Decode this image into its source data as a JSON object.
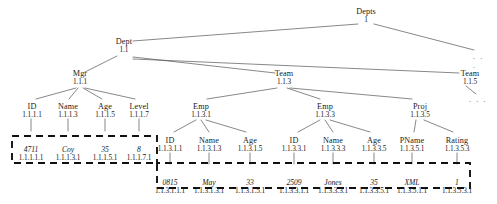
{
  "figure": {
    "kind": "xml-tree-with-dewey-ids",
    "title": "",
    "dots_label": ". . ."
  },
  "nodes": [
    {
      "id": "depts",
      "label": "Depts",
      "dewey": "1",
      "x": 366,
      "y": 8,
      "type": "element"
    },
    {
      "id": "dept",
      "label": "Dept",
      "dewey": "1.1",
      "x": 124,
      "y": 38,
      "type": "element"
    },
    {
      "id": "mgr",
      "label": "Mgr",
      "dewey": "1.1.1",
      "x": 80,
      "y": 70,
      "type": "element"
    },
    {
      "id": "team1",
      "label": "Team",
      "dewey": "1.1.3",
      "x": 284,
      "y": 70,
      "type": "element"
    },
    {
      "id": "team2",
      "label": "Team",
      "dewey": "1.1.5",
      "x": 470,
      "y": 70,
      "type": "element"
    },
    {
      "id": "mgr_id",
      "label": "ID",
      "dewey": "1.1.1.1",
      "x": 32,
      "y": 103,
      "type": "element"
    },
    {
      "id": "mgr_name",
      "label": "Name",
      "dewey": "1.1.1.3",
      "x": 68,
      "y": 103,
      "type": "element"
    },
    {
      "id": "mgr_age",
      "label": "Age",
      "dewey": "1.1.1.5",
      "x": 105,
      "y": 103,
      "type": "element"
    },
    {
      "id": "mgr_level",
      "label": "Level",
      "dewey": "1.1.1.7",
      "x": 139,
      "y": 103,
      "type": "element"
    },
    {
      "id": "emp1",
      "label": "Emp",
      "dewey": "1.1.3.1",
      "x": 201,
      "y": 103,
      "type": "element"
    },
    {
      "id": "emp2",
      "label": "Emp",
      "dewey": "1.1.3.3",
      "x": 325,
      "y": 103,
      "type": "element"
    },
    {
      "id": "proj",
      "label": "Proj",
      "dewey": "1.1.3.5",
      "x": 420,
      "y": 103,
      "type": "element"
    },
    {
      "id": "e1_id",
      "label": "ID",
      "dewey": "1.1.3.1.1",
      "x": 170,
      "y": 137,
      "type": "element"
    },
    {
      "id": "e1_name",
      "label": "Name",
      "dewey": "1.1.3.1.3",
      "x": 209,
      "y": 137,
      "type": "element"
    },
    {
      "id": "e1_age",
      "label": "Age",
      "dewey": "1.1.3.1.5",
      "x": 250,
      "y": 137,
      "type": "element"
    },
    {
      "id": "e2_id",
      "label": "ID",
      "dewey": "1.1.3.3.1",
      "x": 294,
      "y": 137,
      "type": "element"
    },
    {
      "id": "e2_name",
      "label": "Name",
      "dewey": "1.1.3.3.3",
      "x": 333,
      "y": 137,
      "type": "element"
    },
    {
      "id": "e2_age",
      "label": "Age",
      "dewey": "1.1.3.3.5",
      "x": 374,
      "y": 137,
      "type": "element"
    },
    {
      "id": "p_pname",
      "label": "PName",
      "dewey": "1.1.3.5.1",
      "x": 412,
      "y": 137,
      "type": "element"
    },
    {
      "id": "p_rating",
      "label": "Rating",
      "dewey": "1.1.3.5.3",
      "x": 457,
      "y": 137,
      "type": "element"
    }
  ],
  "values": [
    {
      "id": "v_mgr_id",
      "text": "4711",
      "dewey": "1.1.1.1.1",
      "x": 31,
      "y": 146,
      "type": "text"
    },
    {
      "id": "v_mgr_name",
      "text": "Coy",
      "dewey": "1.1.1.3.1",
      "x": 68,
      "y": 146,
      "type": "text"
    },
    {
      "id": "v_mgr_age",
      "text": "35",
      "dewey": "1.1.1.5.1",
      "x": 105,
      "y": 146,
      "type": "text"
    },
    {
      "id": "v_mgr_level",
      "text": "8",
      "dewey": "1.1.1.7.1",
      "x": 139,
      "y": 146,
      "type": "text"
    },
    {
      "id": "v_e1_id",
      "text": "0815",
      "dewey": "1.1.3.1.1.1",
      "x": 170,
      "y": 179,
      "type": "text"
    },
    {
      "id": "v_e1_name",
      "text": "May",
      "dewey": "1.1.3.1.3.1",
      "x": 209,
      "y": 179,
      "type": "text"
    },
    {
      "id": "v_e1_age",
      "text": "33",
      "dewey": "1.1.3.1.5.1",
      "x": 250,
      "y": 179,
      "type": "text"
    },
    {
      "id": "v_e2_id",
      "text": "2509",
      "dewey": "1.1.3.3.1.1",
      "x": 294,
      "y": 179,
      "type": "text"
    },
    {
      "id": "v_e2_name",
      "text": "Jones",
      "dewey": "1.1.3.3.3.1",
      "x": 333,
      "y": 179,
      "type": "text"
    },
    {
      "id": "v_e2_age",
      "text": "35",
      "dewey": "1.1.3.3.5.1",
      "x": 374,
      "y": 179,
      "type": "text"
    },
    {
      "id": "v_p_pname",
      "text": "XML",
      "dewey": "1.1.3.5.1.1",
      "x": 412,
      "y": 179,
      "type": "text"
    },
    {
      "id": "v_p_rating",
      "text": "1",
      "dewey": "1.1.3.5.3.1",
      "x": 457,
      "y": 179,
      "type": "text"
    }
  ],
  "ellipses": [
    {
      "id": "dots_root",
      "x": 481,
      "y": 52
    },
    {
      "id": "dots_team2",
      "x": 478,
      "y": 95
    }
  ],
  "colors": {
    "edge": "#555555",
    "text": "#1a1a1a",
    "dashed_region": "#111111",
    "background": "#ffffff"
  }
}
